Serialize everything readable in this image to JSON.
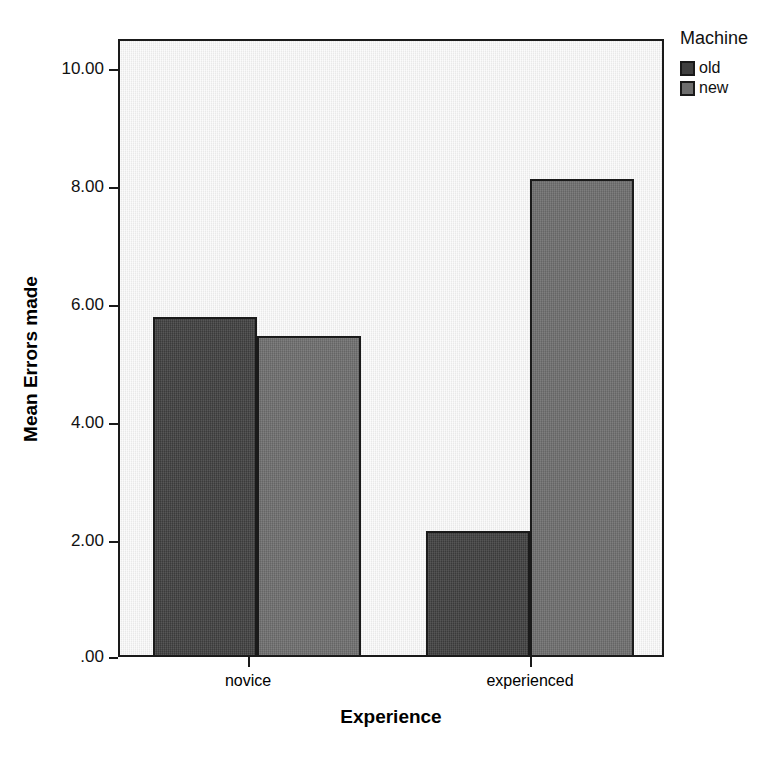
{
  "chart_data": {
    "type": "bar",
    "title": "",
    "subtitle": "",
    "xlabel": "Experience",
    "ylabel": "Mean Errors made",
    "categories": [
      "novice",
      "experienced"
    ],
    "series": [
      {
        "name": "old",
        "values": [
          5.82,
          2.15
        ],
        "color": "#404040"
      },
      {
        "name": "new",
        "values": [
          5.49,
          8.17
        ],
        "color": "#6e6e6e"
      }
    ],
    "legend_title": "Machine",
    "legend_position": "top-right",
    "grid": false,
    "ylim": [
      0,
      10.5
    ],
    "ytick_values": [
      10.0,
      8.0,
      6.0,
      4.0,
      2.0,
      0.0
    ],
    "ytick_labels": [
      "10.00",
      "8.00",
      "6.00",
      "4.00",
      "2.00",
      ".00"
    ],
    "xtick_labels": [
      "novice",
      "experienced"
    ],
    "plot_background": "#f1f1f1",
    "axis_color": "#1a1a1a"
  }
}
